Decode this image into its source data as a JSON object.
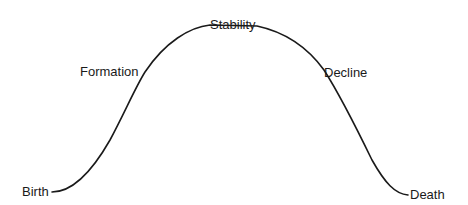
{
  "diagram": {
    "type": "lifecycle-curve",
    "stages": [
      {
        "id": "birth",
        "label": "Birth"
      },
      {
        "id": "formation",
        "label": "Formation"
      },
      {
        "id": "stability",
        "label": "Stability"
      },
      {
        "id": "decline",
        "label": "Decline"
      },
      {
        "id": "death",
        "label": "Death"
      }
    ],
    "line_color": "#1a1a1a",
    "background": "#ffffff"
  }
}
